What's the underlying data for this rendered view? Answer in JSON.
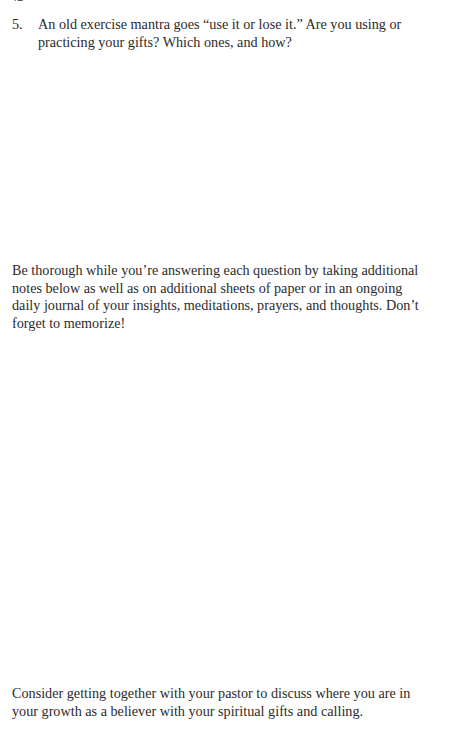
{
  "page": {
    "folio": "42",
    "background_color": "#ffffff",
    "text_color": "#2b2b2b"
  },
  "question": {
    "number": "5.",
    "text": "An old exercise mantra goes “use it or lose it.” Are you using or practicing your gifts? Which ones, and how?"
  },
  "answer_spaces": [
    {
      "label": "blank writing area following question 5"
    },
    {
      "label": "blank writing area for additional notes"
    }
  ],
  "paragraphs": {
    "instructions": "Be thorough while you’re answering each question by taking additional notes below as well as on additional sheets of paper or in an ongoing daily journal of your insights, meditations, prayers, and thoughts. Don’t forget to memorize!",
    "closing": "Consider getting together with your pastor to discuss where you are in your growth as a believer with your spiritual gifts and calling."
  }
}
